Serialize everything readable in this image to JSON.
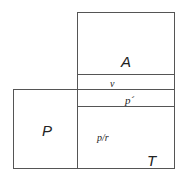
{
  "diagram": {
    "labels": {
      "A": "A",
      "v": "v",
      "p_prime": "p´",
      "P": "P",
      "p_over_r": "p/r",
      "T": "T"
    },
    "stroke_color": "#555555",
    "background": "#ffffff"
  }
}
